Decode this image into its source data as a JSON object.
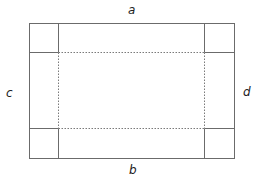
{
  "diagram": {
    "labels": {
      "top": "a",
      "bottom": "b",
      "left": "c",
      "right": "d"
    },
    "colors": {
      "line": "#6b6b6b",
      "dotted": "#7a7a7a",
      "label": "#222222",
      "background": "#ffffff"
    },
    "geometry": {
      "outer_rect": {
        "x1": 29,
        "y1": 23,
        "x2": 234,
        "y2": 158
      },
      "inner_vertical_x": [
        58,
        204
      ],
      "inner_horizontal_y": [
        52,
        128
      ],
      "corner_squares": [
        "top-left",
        "top-right",
        "bottom-left",
        "bottom-right"
      ],
      "fold_lines_style": "dotted"
    }
  }
}
